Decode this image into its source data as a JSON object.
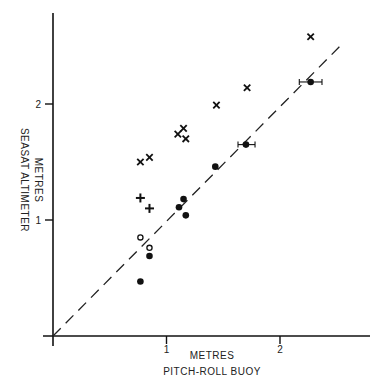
{
  "chart_data": {
    "type": "scatter",
    "title": "",
    "xlabel": [
      "METRES",
      "PITCH-ROLL BUOY"
    ],
    "ylabel": [
      "METRES",
      "SEASAT ALTIMETER"
    ],
    "xlim": [
      0,
      2.75
    ],
    "ylim": [
      0,
      2.8
    ],
    "x_ticks": [
      {
        "value": 1,
        "label": "1"
      },
      {
        "value": 2,
        "label": "2"
      }
    ],
    "y_ticks": [
      {
        "value": 1,
        "label": "1"
      },
      {
        "value": 2,
        "label": "2"
      }
    ],
    "grid": false,
    "legend": null,
    "reference_line": {
      "name": "y = x",
      "style": "dashed",
      "from": [
        0,
        0
      ],
      "to": [
        2.54,
        2.51
      ]
    },
    "series": [
      {
        "name": "cross",
        "marker": "x",
        "points": [
          {
            "x": 0.77,
            "y": 1.5
          },
          {
            "x": 0.85,
            "y": 1.54
          },
          {
            "x": 1.1,
            "y": 1.74
          },
          {
            "x": 1.15,
            "y": 1.79
          },
          {
            "x": 1.17,
            "y": 1.7
          },
          {
            "x": 1.44,
            "y": 1.99
          },
          {
            "x": 1.71,
            "y": 2.14
          },
          {
            "x": 2.27,
            "y": 2.58
          }
        ]
      },
      {
        "name": "plus",
        "marker": "+",
        "points": [
          {
            "x": 0.77,
            "y": 1.19
          },
          {
            "x": 0.85,
            "y": 1.1
          }
        ]
      },
      {
        "name": "filled-circle",
        "marker": "filled-circle",
        "points": [
          {
            "x": 0.77,
            "y": 0.47
          },
          {
            "x": 0.85,
            "y": 0.69
          },
          {
            "x": 1.11,
            "y": 1.11
          },
          {
            "x": 1.15,
            "y": 1.18
          },
          {
            "x": 1.17,
            "y": 1.04
          },
          {
            "x": 1.43,
            "y": 1.46
          },
          {
            "x": 1.7,
            "y": 1.65,
            "xerr": [
              1.63,
              1.78
            ]
          },
          {
            "x": 2.27,
            "y": 2.19,
            "xerr": [
              2.17,
              2.37
            ]
          }
        ]
      },
      {
        "name": "open-circle",
        "marker": "open-circle",
        "points": [
          {
            "x": 0.77,
            "y": 0.85
          },
          {
            "x": 0.85,
            "y": 0.76
          }
        ]
      }
    ]
  }
}
